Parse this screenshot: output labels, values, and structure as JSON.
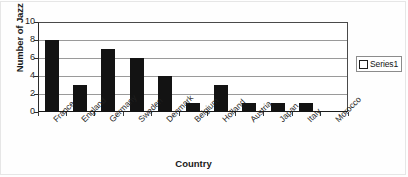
{
  "chart_data": {
    "type": "bar",
    "title": "",
    "xlabel": "Country",
    "ylabel": "Number of Jazz Musicians",
    "categories": [
      "France",
      "England",
      "Germany",
      "Sweden",
      "Denmark",
      "Belgium",
      "Holland",
      "Austria",
      "Japan",
      "Italy",
      "Morocco"
    ],
    "values": [
      8,
      3,
      7,
      6,
      4,
      1,
      3,
      1,
      1,
      1,
      0
    ],
    "series": [
      {
        "name": "Series1",
        "values": [
          8,
          3,
          7,
          6,
          4,
          1,
          3,
          1,
          1,
          1,
          0
        ]
      }
    ],
    "ylim": [
      0,
      10
    ],
    "y_ticks": [
      0,
      2,
      4,
      6,
      8,
      10
    ],
    "y_tick_labels": [
      "0",
      "2",
      "4",
      "6",
      "8",
      "10"
    ],
    "grid": true,
    "grid_axis": "y",
    "legend_position": "right",
    "bar_color": "#131313",
    "plot_background": "#ffffff",
    "axis_color": "#1a1a1a",
    "gridline_color": "#9a9a9a"
  },
  "legend": {
    "entries": [
      {
        "label": "Series1",
        "swatch_color": "#ffffff",
        "swatch_border": "#1c1c1c"
      }
    ]
  }
}
